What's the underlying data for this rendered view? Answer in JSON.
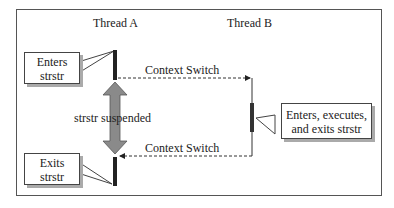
{
  "diagram": {
    "threads": [
      {
        "name": "Thread A"
      },
      {
        "name": "Thread B"
      }
    ],
    "callouts": {
      "enters": {
        "line1": "Enters",
        "line2": "strstr"
      },
      "exits": {
        "line1": "Exits",
        "line2": "strstr"
      },
      "thread_b": {
        "line1": "Enters, executes,",
        "line2": "and exits strstr"
      }
    },
    "context_switch_1": "Context Switch",
    "context_switch_2": "Context Switch",
    "suspended_label": "strstr suspended",
    "colors": {
      "bar": "#222222",
      "arrow_fill": "#8a8a8a",
      "line": "#333333",
      "frame": "#555555"
    }
  }
}
